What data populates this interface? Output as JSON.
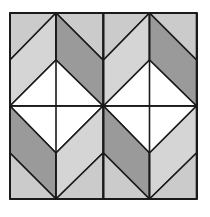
{
  "diagram": {
    "bounds": {
      "x": 10,
      "y": 13,
      "size": 187
    },
    "colors": {
      "light_gray": "#cbcbcb",
      "lighter_gray": "#d5d5d5",
      "dark_gray": "#9a9a9a",
      "white": "#ffffff",
      "line": "#1a1a1a"
    },
    "grid": {
      "columns": 4,
      "rows": 4
    }
  }
}
